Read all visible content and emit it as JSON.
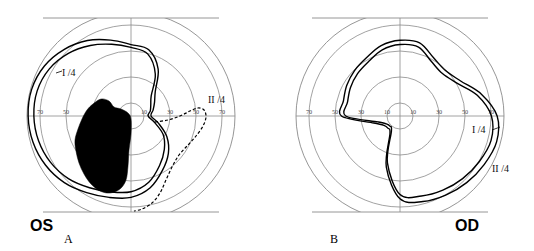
{
  "figure": {
    "background_color": "#ffffff",
    "grid_color": "#8a8a8a",
    "plot_color": "#000000",
    "scotoma_color": "#000000",
    "width": 534,
    "height": 251
  },
  "panels": [
    {
      "id": "panel-os",
      "letter": "A",
      "eye_label": "OS",
      "eye_label_full": "oculus sinister (left eye)",
      "center": {
        "cx": 131,
        "cy": 116
      },
      "degrees_per_pixel": 0.7,
      "grid": {
        "ring_degrees": [
          10,
          30,
          50,
          70
        ],
        "ring_radii_px": [
          13,
          39,
          65,
          91
        ],
        "outer_radius_px": 104,
        "outer_degrees": 80,
        "meridians": [
          "horizontal",
          "vertical"
        ],
        "top_flat_clip_px": 18,
        "bottom_flat_clip_px": 212,
        "show_grid": true
      },
      "tick_labels": {
        "left": [
          "70",
          "50",
          "30",
          "10"
        ],
        "right": [
          "10",
          "30",
          "50",
          "70"
        ],
        "left_x_px": [
          40,
          66,
          92,
          118
        ],
        "right_x_px": [
          144,
          170,
          196,
          222
        ],
        "y_px": 114
      },
      "isopters": [
        {
          "name": "I /4",
          "label": "I /4",
          "label_x_px": 62,
          "label_y_px": 76,
          "line_style": "solid",
          "stroke_width": 1.4,
          "radii_deg_by_angle": [
            {
              "a": 0,
              "r": 12
            },
            {
              "a": 15,
              "r": 14
            },
            {
              "a": 30,
              "r": 16
            },
            {
              "a": 45,
              "r": 20
            },
            {
              "a": 60,
              "r": 34
            },
            {
              "a": 75,
              "r": 45
            },
            {
              "a": 90,
              "r": 48
            },
            {
              "a": 105,
              "r": 52
            },
            {
              "a": 120,
              "r": 57
            },
            {
              "a": 135,
              "r": 62
            },
            {
              "a": 150,
              "r": 66
            },
            {
              "a": 165,
              "r": 68
            },
            {
              "a": 180,
              "r": 68
            },
            {
              "a": 195,
              "r": 67
            },
            {
              "a": 210,
              "r": 65
            },
            {
              "a": 225,
              "r": 62
            },
            {
              "a": 240,
              "r": 58
            },
            {
              "a": 255,
              "r": 55
            },
            {
              "a": 270,
              "r": 53
            },
            {
              "a": 285,
              "r": 48
            },
            {
              "a": 300,
              "r": 40
            },
            {
              "a": 315,
              "r": 33
            },
            {
              "a": 330,
              "r": 26
            },
            {
              "a": 345,
              "r": 17
            }
          ]
        },
        {
          "name": "II /4",
          "label": "II /4",
          "label_x_px": 208,
          "label_y_px": 103,
          "line_style": "solid",
          "stroke_width": 1.4,
          "radii_deg_by_angle": [
            {
              "a": 0,
              "r": 14
            },
            {
              "a": 15,
              "r": 16
            },
            {
              "a": 30,
              "r": 19
            },
            {
              "a": 45,
              "r": 24
            },
            {
              "a": 60,
              "r": 38
            },
            {
              "a": 75,
              "r": 48
            },
            {
              "a": 90,
              "r": 50
            },
            {
              "a": 105,
              "r": 55
            },
            {
              "a": 120,
              "r": 61
            },
            {
              "a": 135,
              "r": 66
            },
            {
              "a": 150,
              "r": 70
            },
            {
              "a": 165,
              "r": 72
            },
            {
              "a": 180,
              "r": 72
            },
            {
              "a": 195,
              "r": 71
            },
            {
              "a": 210,
              "r": 69
            },
            {
              "a": 225,
              "r": 66
            },
            {
              "a": 240,
              "r": 62
            },
            {
              "a": 255,
              "r": 59
            },
            {
              "a": 270,
              "r": 57
            },
            {
              "a": 285,
              "r": 52
            },
            {
              "a": 300,
              "r": 44
            },
            {
              "a": 315,
              "r": 37
            },
            {
              "a": 330,
              "r": 29
            },
            {
              "a": 345,
              "r": 20
            }
          ]
        },
        {
          "name": "II /4 dashed nasal segment",
          "label": "",
          "line_style": "dashed",
          "dash_pattern": "3,2",
          "stroke_width": 1.2,
          "path_points_px": [
            {
              "x": 155,
              "y": 122
            },
            {
              "x": 168,
              "y": 120
            },
            {
              "x": 180,
              "y": 116
            },
            {
              "x": 190,
              "y": 111
            },
            {
              "x": 198,
              "y": 108
            },
            {
              "x": 204,
              "y": 110
            },
            {
              "x": 206,
              "y": 117
            },
            {
              "x": 203,
              "y": 126
            },
            {
              "x": 196,
              "y": 136
            },
            {
              "x": 188,
              "y": 145
            },
            {
              "x": 179,
              "y": 155
            },
            {
              "x": 172,
              "y": 167
            },
            {
              "x": 166,
              "y": 180
            },
            {
              "x": 160,
              "y": 193
            },
            {
              "x": 152,
              "y": 203
            },
            {
              "x": 142,
              "y": 209
            },
            {
              "x": 134,
              "y": 211
            }
          ]
        }
      ],
      "scotoma": {
        "name": "absolute-scotoma",
        "fill": "#000000",
        "description": "large dense inferonasal/central scotoma",
        "polygon_px": [
          {
            "x": 93,
            "y": 104
          },
          {
            "x": 101,
            "y": 99
          },
          {
            "x": 109,
            "y": 101
          },
          {
            "x": 114,
            "y": 107
          },
          {
            "x": 121,
            "y": 109
          },
          {
            "x": 128,
            "y": 113
          },
          {
            "x": 131,
            "y": 119
          },
          {
            "x": 131,
            "y": 134
          },
          {
            "x": 129,
            "y": 150
          },
          {
            "x": 128,
            "y": 166
          },
          {
            "x": 126,
            "y": 180
          },
          {
            "x": 120,
            "y": 189
          },
          {
            "x": 110,
            "y": 193
          },
          {
            "x": 100,
            "y": 191
          },
          {
            "x": 91,
            "y": 184
          },
          {
            "x": 84,
            "y": 174
          },
          {
            "x": 79,
            "y": 163
          },
          {
            "x": 76,
            "y": 151
          },
          {
            "x": 75,
            "y": 140
          },
          {
            "x": 78,
            "y": 129
          },
          {
            "x": 82,
            "y": 119
          },
          {
            "x": 87,
            "y": 110
          }
        ]
      }
    },
    {
      "id": "panel-od",
      "letter": "B",
      "eye_label": "OD",
      "eye_label_full": "oculus dexter (right eye)",
      "center": {
        "cx": 400,
        "cy": 116
      },
      "degrees_per_pixel": 0.7,
      "grid": {
        "ring_degrees": [
          10,
          30,
          50,
          70
        ],
        "ring_radii_px": [
          13,
          39,
          65,
          91
        ],
        "outer_radius_px": 104,
        "outer_degrees": 80,
        "meridians": [
          "horizontal",
          "vertical"
        ],
        "top_flat_clip_px": 18,
        "bottom_flat_clip_px": 212,
        "show_grid": true
      },
      "tick_labels": {
        "left": [
          "70",
          "50",
          "30",
          "10"
        ],
        "right": [
          "10",
          "30",
          "50",
          "70"
        ],
        "left_x_px": [
          309,
          335,
          361,
          387
        ],
        "right_x_px": [
          413,
          439,
          465,
          491
        ],
        "y_px": 114
      },
      "isopters": [
        {
          "name": "I /4",
          "label": "I /4",
          "label_x_px": 472,
          "label_y_px": 133,
          "line_style": "solid",
          "stroke_width": 1.4,
          "radii_deg_by_angle": [
            {
              "a": 0,
              "r": 64
            },
            {
              "a": 15,
              "r": 56
            },
            {
              "a": 30,
              "r": 46
            },
            {
              "a": 45,
              "r": 42
            },
            {
              "a": 60,
              "r": 44
            },
            {
              "a": 75,
              "r": 50
            },
            {
              "a": 90,
              "r": 50
            },
            {
              "a": 105,
              "r": 48
            },
            {
              "a": 120,
              "r": 44
            },
            {
              "a": 135,
              "r": 42
            },
            {
              "a": 150,
              "r": 40
            },
            {
              "a": 165,
              "r": 38
            },
            {
              "a": 180,
              "r": 38
            },
            {
              "a": 195,
              "r": 16
            },
            {
              "a": 210,
              "r": 11
            },
            {
              "a": 225,
              "r": 10
            },
            {
              "a": 240,
              "r": 12
            },
            {
              "a": 255,
              "r": 34
            },
            {
              "a": 270,
              "r": 55
            },
            {
              "a": 285,
              "r": 58
            },
            {
              "a": 300,
              "r": 60
            },
            {
              "a": 315,
              "r": 62
            },
            {
              "a": 330,
              "r": 64
            },
            {
              "a": 345,
              "r": 66
            }
          ]
        },
        {
          "name": "II /4",
          "label": "II /4",
          "label_x_px": 492,
          "label_y_px": 172,
          "line_style": "solid",
          "stroke_width": 1.4,
          "radii_deg_by_angle": [
            {
              "a": 0,
              "r": 68
            },
            {
              "a": 15,
              "r": 59
            },
            {
              "a": 30,
              "r": 49
            },
            {
              "a": 45,
              "r": 45
            },
            {
              "a": 60,
              "r": 47
            },
            {
              "a": 75,
              "r": 53
            },
            {
              "a": 90,
              "r": 53
            },
            {
              "a": 105,
              "r": 51
            },
            {
              "a": 120,
              "r": 47
            },
            {
              "a": 135,
              "r": 45
            },
            {
              "a": 150,
              "r": 43
            },
            {
              "a": 165,
              "r": 41
            },
            {
              "a": 180,
              "r": 41
            },
            {
              "a": 195,
              "r": 19
            },
            {
              "a": 210,
              "r": 13
            },
            {
              "a": 225,
              "r": 12
            },
            {
              "a": 240,
              "r": 14
            },
            {
              "a": 255,
              "r": 37
            },
            {
              "a": 270,
              "r": 58
            },
            {
              "a": 285,
              "r": 62
            },
            {
              "a": 300,
              "r": 64
            },
            {
              "a": 315,
              "r": 66
            },
            {
              "a": 330,
              "r": 68
            },
            {
              "a": 345,
              "r": 70
            }
          ]
        }
      ],
      "scotoma": null
    }
  ],
  "chart_data": {
    "type": "line",
    "subtype": "polar-kinetic-perimetry",
    "xlabel": "horizontal meridian (degrees)",
    "ylabel": "vertical meridian (degrees)",
    "grid": true,
    "legend_position": "inline-annotations",
    "axis_tick_labels": [
      "70",
      "50",
      "30",
      "10",
      "10",
      "30",
      "50",
      "70"
    ],
    "radial_rings_deg": [
      10,
      30,
      50,
      70
    ],
    "outer_boundary_deg": 80,
    "panels": [
      {
        "panel": "A",
        "eye": "OS",
        "series": [
          {
            "name": "I /4",
            "style": "solid",
            "angles_deg": [
              0,
              15,
              30,
              45,
              60,
              75,
              90,
              105,
              120,
              135,
              150,
              165,
              180,
              195,
              210,
              225,
              240,
              255,
              270,
              285,
              300,
              315,
              330,
              345
            ],
            "radii_deg": [
              12,
              14,
              16,
              20,
              34,
              45,
              48,
              52,
              57,
              62,
              66,
              68,
              68,
              67,
              65,
              62,
              58,
              55,
              53,
              48,
              40,
              33,
              26,
              17
            ]
          },
          {
            "name": "II /4",
            "style": "solid",
            "angles_deg": [
              0,
              15,
              30,
              45,
              60,
              75,
              90,
              105,
              120,
              135,
              150,
              165,
              180,
              195,
              210,
              225,
              240,
              255,
              270,
              285,
              300,
              315,
              330,
              345
            ],
            "radii_deg": [
              14,
              16,
              19,
              24,
              38,
              48,
              50,
              55,
              61,
              66,
              70,
              72,
              72,
              71,
              69,
              66,
              62,
              59,
              57,
              52,
              44,
              37,
              29,
              20
            ]
          },
          {
            "name": "II /4 dashed temporal residual",
            "style": "dashed",
            "note": "dashed loop in nasal-inferior quadrant"
          }
        ],
        "scotoma": {
          "present": true,
          "type": "absolute",
          "fill": "solid black",
          "location": "large central/inferonasal dense defect"
        }
      },
      {
        "panel": "B",
        "eye": "OD",
        "series": [
          {
            "name": "I /4",
            "style": "solid",
            "angles_deg": [
              0,
              15,
              30,
              45,
              60,
              75,
              90,
              105,
              120,
              135,
              150,
              165,
              180,
              195,
              210,
              225,
              240,
              255,
              270,
              285,
              300,
              315,
              330,
              345
            ],
            "radii_deg": [
              64,
              56,
              46,
              42,
              44,
              50,
              50,
              48,
              44,
              42,
              40,
              38,
              38,
              16,
              11,
              10,
              12,
              34,
              55,
              58,
              60,
              62,
              64,
              66
            ]
          },
          {
            "name": "II /4",
            "style": "solid",
            "angles_deg": [
              0,
              15,
              30,
              45,
              60,
              75,
              90,
              105,
              120,
              135,
              150,
              165,
              180,
              195,
              210,
              225,
              240,
              255,
              270,
              285,
              300,
              315,
              330,
              345
            ],
            "radii_deg": [
              68,
              59,
              49,
              45,
              47,
              53,
              53,
              51,
              47,
              45,
              43,
              41,
              41,
              19,
              13,
              12,
              14,
              37,
              58,
              62,
              64,
              66,
              68,
              70
            ]
          }
        ],
        "scotoma": {
          "present": false
        }
      }
    ]
  }
}
